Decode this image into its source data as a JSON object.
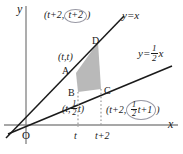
{
  "figure": {
    "axes": {
      "y_label": "y",
      "x_label": "x",
      "origin_label": "O"
    },
    "ticks": {
      "x": [
        {
          "label": "t",
          "value": "t"
        },
        {
          "label": "t+2",
          "value": "t+2"
        }
      ]
    },
    "lines": [
      {
        "id": "line-y-equals-x",
        "equation_text": "y=x",
        "slope": 1
      },
      {
        "id": "line-y-equals-half-x",
        "equation_text_prefix": "y=",
        "equation_numerator": "1",
        "equation_denominator": "2",
        "equation_variable": "x",
        "slope": 0.5
      }
    ],
    "vertices": [
      {
        "name": "A",
        "letter": "A"
      },
      {
        "name": "B",
        "letter": "B"
      },
      {
        "name": "C",
        "letter": "C"
      },
      {
        "name": "D",
        "letter": "D"
      }
    ],
    "coordinates": {
      "D": {
        "open": "(",
        "first": "t+2,",
        "circled": "t+2",
        "close": ")"
      },
      "A": {
        "text": "(t,t)"
      },
      "B": {
        "open": "(",
        "first": "t,",
        "num": "1",
        "den": "2",
        "var": "t",
        "close": ")"
      },
      "C": {
        "open": "(",
        "first": "t+2,",
        "num": "1",
        "den": "2",
        "var": "t+1",
        "close": ")"
      }
    },
    "colors": {
      "shade_fill": "#b9b9b9",
      "line_stroke": "#1a1a1a",
      "axis_stroke": "#8a8a8a",
      "highlight_circle": "#9a9aa5",
      "background": "#ffffff"
    }
  }
}
